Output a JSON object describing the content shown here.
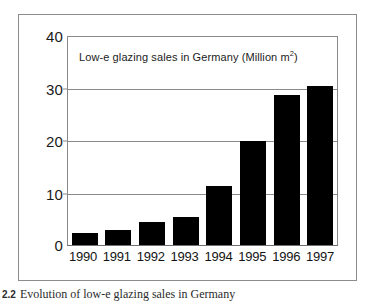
{
  "chart_data": {
    "type": "bar",
    "title": "Low-e glazing sales in Germany (Million m",
    "title_superscript": "2",
    "title_suffix": ")",
    "categories": [
      "1990",
      "1991",
      "1992",
      "1993",
      "1994",
      "1995",
      "1996",
      "1997"
    ],
    "values": [
      2.3,
      2.9,
      4.4,
      5.4,
      11.3,
      20.0,
      28.8,
      30.5
    ],
    "xlabel": "",
    "ylabel": "",
    "ylim": [
      0,
      40
    ],
    "yticks": [
      "0",
      "10",
      "20",
      "30",
      "40"
    ],
    "ytick_values": [
      0,
      10,
      20,
      30,
      40
    ],
    "grid": true,
    "legend": false,
    "bar_color": "#000000",
    "grid_color": "#8a8a8a",
    "frame_color": "#8c8c8c"
  },
  "caption": {
    "number": "2.2",
    "text": "Evolution of low-e glazing sales in Germany"
  }
}
